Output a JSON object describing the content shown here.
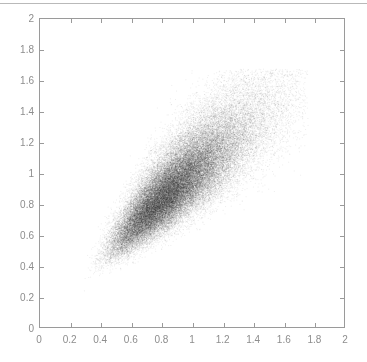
{
  "figure": {
    "background_color": "#ffffff",
    "top_rule_color": "#b9b9b9",
    "axis_color": "#9a9a9a",
    "tick_label_color": "#8d8d8d",
    "point_color": "#2b2b2b"
  },
  "chart_data": {
    "type": "scatter",
    "title": "",
    "subtitle": "",
    "xlabel": "",
    "ylabel": "",
    "xlim": [
      0,
      2
    ],
    "ylim": [
      0,
      2
    ],
    "xticks": [
      0,
      0.2,
      0.4,
      0.6,
      0.8,
      1,
      1.2,
      1.4,
      1.6,
      1.8,
      2
    ],
    "yticks": [
      0,
      0.2,
      0.4,
      0.6,
      0.8,
      1,
      1.2,
      1.4,
      1.6,
      1.8,
      2
    ],
    "xtick_labels": [
      "0",
      "0.2",
      "0.4",
      "0.6",
      "0.8",
      "1",
      "1.2",
      "1.4",
      "1.6",
      "1.8",
      "2"
    ],
    "ytick_labels": [
      "0",
      "0.2",
      "0.4",
      "0.6",
      "0.8",
      "1",
      "1.2",
      "1.4",
      "1.6",
      "1.8",
      "2"
    ],
    "grid": false,
    "legend": null,
    "legend_position": "none",
    "annotations": [],
    "tick_direction": "in",
    "tick_sides": [
      "bottom",
      "left",
      "top",
      "right"
    ],
    "box": true,
    "marker": {
      "style": "dot",
      "size_px": 1,
      "color": "#2b2b2b",
      "alpha": 0.08
    },
    "series": [
      {
        "name": "samples",
        "n_points": 60000,
        "distribution": "bivariate-lognormal-like",
        "correlation": 0.85,
        "x_mean": 0.88,
        "y_mean": 0.92,
        "x_std": 0.26,
        "y_std": 0.26,
        "x_range_observed": [
          0.05,
          1.75
        ],
        "y_range_observed": [
          0.05,
          1.68
        ],
        "density_peak": [
          0.9,
          0.95
        ]
      }
    ]
  }
}
